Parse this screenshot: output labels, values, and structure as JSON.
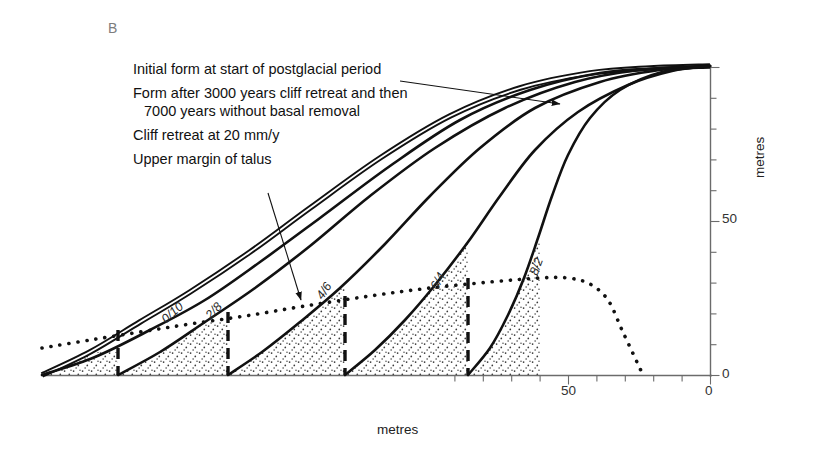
{
  "panel": {
    "label": "B"
  },
  "legend": {
    "items": [
      {
        "id": "initial-form",
        "text": "Initial form at start of postglacial period"
      },
      {
        "id": "form-after",
        "text": "Form after 3000 years cliff retreat and then"
      },
      {
        "id": "form-after-cont",
        "text": "7000 years without basal removal"
      },
      {
        "id": "cliff-retreat",
        "text": "Cliff retreat at 20 mm/y"
      },
      {
        "id": "upper-talus",
        "text": "Upper margin of talus"
      }
    ]
  },
  "axes": {
    "x": {
      "label": "metres",
      "ticks": [
        {
          "value": "50",
          "x": 568
        },
        {
          "value": "0",
          "x": 710
        }
      ]
    },
    "y": {
      "label": "metres",
      "ticks": [
        {
          "value": "50",
          "y": 220
        },
        {
          "value": "0",
          "y": 375
        }
      ]
    }
  },
  "curve_labels": [
    {
      "text": "0/10",
      "x": 168,
      "y": 312,
      "rot": -42
    },
    {
      "text": "2/8",
      "x": 213,
      "y": 308,
      "rot": -47
    },
    {
      "text": "4/6",
      "x": 325,
      "y": 288,
      "rot": -56
    },
    {
      "text": "6/4",
      "x": 440,
      "y": 278,
      "rot": -62
    },
    {
      "text": "8/2",
      "x": 540,
      "y": 263,
      "rot": -70
    }
  ],
  "chart_data": {
    "type": "line",
    "title": "",
    "xlabel": "metres",
    "ylabel": "metres",
    "xlim": [
      0,
      100
    ],
    "ylim": [
      0,
      100
    ],
    "grid": false,
    "legend_position": "upper-left",
    "note": "Cliff retreat / slope decline profiles. X axis runs right-to-left (0 at right). Curve tags give ratio of cliff-retreat phase to basal-removal-free phase in thousands of years.",
    "series": [
      {
        "name": "Initial form at start of postglacial period",
        "style": "double-solid",
        "tag": "",
        "points": [
          [
            42,
            375
          ],
          [
            90,
            352
          ],
          [
            140,
            322
          ],
          [
            190,
            292
          ],
          [
            250,
            252
          ],
          [
            310,
            208
          ],
          [
            380,
            158
          ],
          [
            450,
            116
          ],
          [
            520,
            88
          ],
          [
            590,
            73
          ],
          [
            650,
            68
          ],
          [
            710,
            66
          ]
        ]
      },
      {
        "name": "0/10",
        "style": "solid",
        "tag": "0/10",
        "points": [
          [
            42,
            375
          ],
          [
            95,
            357
          ],
          [
            150,
            330
          ],
          [
            205,
            300
          ],
          [
            260,
            262
          ],
          [
            320,
            218
          ],
          [
            390,
            166
          ],
          [
            460,
            120
          ],
          [
            530,
            90
          ],
          [
            600,
            73
          ],
          [
            660,
            68
          ],
          [
            710,
            66
          ]
        ]
      },
      {
        "name": "2/8",
        "style": "solid",
        "tag": "2/8",
        "points": [
          [
            118,
            375
          ],
          [
            160,
            352
          ],
          [
            205,
            322
          ],
          [
            255,
            288
          ],
          [
            310,
            246
          ],
          [
            370,
            196
          ],
          [
            435,
            148
          ],
          [
            505,
            108
          ],
          [
            575,
            82
          ],
          [
            640,
            70
          ],
          [
            710,
            66
          ]
        ]
      },
      {
        "name": "4/6",
        "style": "solid",
        "tag": "4/6",
        "points": [
          [
            228,
            375
          ],
          [
            262,
            352
          ],
          [
            300,
            322
          ],
          [
            340,
            288
          ],
          [
            385,
            244
          ],
          [
            430,
            196
          ],
          [
            480,
            148
          ],
          [
            535,
            108
          ],
          [
            600,
            82
          ],
          [
            660,
            70
          ],
          [
            710,
            66
          ]
        ]
      },
      {
        "name": "6/4",
        "style": "solid",
        "tag": "6/4",
        "points": [
          [
            345,
            375
          ],
          [
            375,
            350
          ],
          [
            405,
            320
          ],
          [
            435,
            285
          ],
          [
            468,
            242
          ],
          [
            500,
            196
          ],
          [
            535,
            150
          ],
          [
            578,
            112
          ],
          [
            628,
            85
          ],
          [
            672,
            71
          ],
          [
            710,
            66
          ]
        ]
      },
      {
        "name": "8/2",
        "style": "solid",
        "tag": "8/2",
        "points": [
          [
            468,
            375
          ],
          [
            490,
            348
          ],
          [
            508,
            315
          ],
          [
            524,
            278
          ],
          [
            538,
            238
          ],
          [
            552,
            196
          ],
          [
            568,
            155
          ],
          [
            590,
            118
          ],
          [
            620,
            90
          ],
          [
            662,
            72
          ],
          [
            710,
            66
          ]
        ]
      },
      {
        "name": "Upper margin of talus",
        "style": "dotted",
        "tag": "",
        "points": [
          [
            42,
            348
          ],
          [
            90,
            340
          ],
          [
            140,
            332
          ],
          [
            190,
            324
          ],
          [
            245,
            316
          ],
          [
            305,
            306
          ],
          [
            370,
            296
          ],
          [
            430,
            288
          ],
          [
            490,
            282
          ],
          [
            540,
            278
          ],
          [
            568,
            278
          ],
          [
            590,
            284
          ],
          [
            608,
            300
          ],
          [
            622,
            330
          ],
          [
            636,
            360
          ],
          [
            643,
            375
          ]
        ]
      },
      {
        "name": "Cliff retreat at 20 mm/y (cliff faces)",
        "style": "dashed",
        "tag": "",
        "cliffs": [
          {
            "top": [
              118,
              330
            ],
            "bottom": [
              118,
              375
            ]
          },
          {
            "top": [
              228,
              312
            ],
            "bottom": [
              228,
              375
            ]
          },
          {
            "top": [
              345,
              296
            ],
            "bottom": [
              345,
              375
            ]
          },
          {
            "top": [
              468,
              278
            ],
            "bottom": [
              468,
              375
            ]
          }
        ]
      }
    ],
    "talus_fill": "stipple"
  },
  "colors": {
    "ink": "#111111",
    "axis": "#6b6b6b",
    "panel_label": "#7d7d7d",
    "stipple": "#3a3a3a"
  }
}
